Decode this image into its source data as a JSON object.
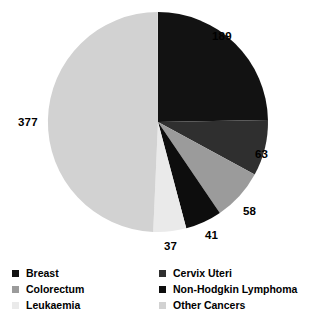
{
  "chart_data": {
    "type": "pie",
    "title": "",
    "subtitle": "",
    "xlabel": "",
    "ylabel": "",
    "grid": false,
    "legend_position": "bottom",
    "total": 765,
    "start_angle_deg": 0,
    "direction": "clockwise",
    "categories": [
      "Breast",
      "Cervix Uteri",
      "Colorectum",
      "Non-Hodgkin Lymphoma",
      "Leukaemia",
      "Other Cancers"
    ],
    "values": [
      189,
      63,
      58,
      41,
      37,
      377
    ],
    "slices": [
      {
        "label": "Breast",
        "value": 189,
        "value_text": "189",
        "color": "#121212",
        "angle_deg": 88.9
      },
      {
        "label": "Cervix Uteri",
        "value": 63,
        "value_text": "63",
        "color": "#2f2f2f",
        "angle_deg": 29.6
      },
      {
        "label": "Colorectum",
        "value": 58,
        "value_text": "58",
        "color": "#9b9b9b",
        "angle_deg": 27.3
      },
      {
        "label": "Non-Hodgkin Lymphoma",
        "value": 41,
        "value_text": "41",
        "color": "#0d0d0d",
        "angle_deg": 19.3
      },
      {
        "label": "Leukaemia",
        "value": 37,
        "value_text": "37",
        "color": "#eaeaea",
        "angle_deg": 17.4
      },
      {
        "label": "Other Cancers",
        "value": 377,
        "value_text": "377",
        "color": "#d2d2d2",
        "angle_deg": 177.4
      }
    ],
    "data_labels": [
      {
        "text": "189",
        "x": 212,
        "y": 30
      },
      {
        "text": "63",
        "x": 255,
        "y": 148
      },
      {
        "text": "58",
        "x": 243,
        "y": 205
      },
      {
        "text": "41",
        "x": 205,
        "y": 229
      },
      {
        "text": "37",
        "x": 164,
        "y": 240
      },
      {
        "text": "377",
        "x": 18,
        "y": 116
      }
    ]
  },
  "legend": {
    "columns": [
      {
        "items": [
          {
            "label": "Breast",
            "color": "#121212",
            "swatch_name": "legend-swatch-breast"
          },
          {
            "label": "Colorectum",
            "color": "#9b9b9b",
            "swatch_name": "legend-swatch-colorectum"
          },
          {
            "label": "Leukaemia",
            "color": "#eaeaea",
            "swatch_name": "legend-swatch-leukaemia"
          }
        ]
      },
      {
        "items": [
          {
            "label": "Cervix Uteri",
            "color": "#2f2f2f",
            "swatch_name": "legend-swatch-cervix-uteri"
          },
          {
            "label": "Non-Hodgkin Lymphoma",
            "color": "#0d0d0d",
            "swatch_name": "legend-swatch-non-hodgkin-lymphoma"
          },
          {
            "label": "Other Cancers",
            "color": "#d2d2d2",
            "swatch_name": "legend-swatch-other-cancers"
          }
        ]
      }
    ]
  },
  "geometry": {
    "center_x": 158,
    "center_y": 122,
    "radius": 110
  }
}
